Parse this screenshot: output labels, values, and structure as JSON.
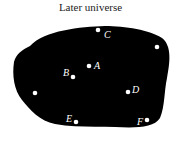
{
  "title": "Later universe",
  "colors": {
    "blob": "#000000",
    "points": "#ffffff",
    "background": "#ffffff"
  },
  "points": [
    {
      "label": "C",
      "x": 98,
      "y": 30,
      "lx": 104,
      "ly": 35
    },
    {
      "label": "",
      "x": 157,
      "y": 47,
      "lx": 0,
      "ly": 0
    },
    {
      "label": "A",
      "x": 89,
      "y": 66,
      "lx": 94,
      "ly": 66
    },
    {
      "label": "B",
      "x": 73,
      "y": 77,
      "lx": 63,
      "ly": 73
    },
    {
      "label": "",
      "x": 35,
      "y": 93,
      "lx": 0,
      "ly": 0
    },
    {
      "label": "D",
      "x": 128,
      "y": 92,
      "lx": 132,
      "ly": 90
    },
    {
      "label": "E",
      "x": 76,
      "y": 122,
      "lx": 66,
      "ly": 119
    },
    {
      "label": "F",
      "x": 147,
      "y": 120,
      "lx": 137,
      "ly": 122
    }
  ]
}
